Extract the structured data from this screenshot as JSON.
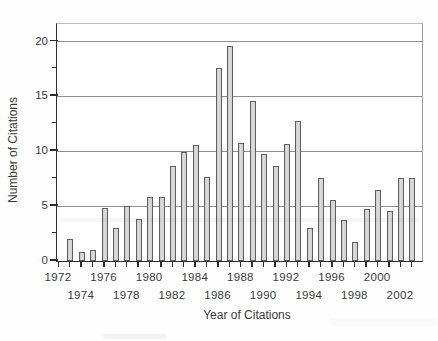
{
  "chart_data": {
    "type": "bar",
    "title": "",
    "xlabel": "Year of Citations",
    "ylabel": "Number of Citations",
    "categories": [
      1973,
      1974,
      1975,
      1976,
      1977,
      1978,
      1979,
      1980,
      1981,
      1982,
      1983,
      1984,
      1985,
      1986,
      1987,
      1988,
      1989,
      1990,
      1991,
      1992,
      1993,
      1994,
      1995,
      1996,
      1997,
      1998,
      1999,
      2000,
      2001,
      2002,
      2003
    ],
    "values": [
      2.0,
      0.8,
      1.0,
      4.8,
      3.0,
      5.0,
      3.8,
      5.8,
      5.8,
      8.7,
      9.9,
      10.6,
      7.7,
      17.6,
      19.6,
      10.8,
      14.6,
      9.8,
      8.7,
      10.7,
      12.8,
      3.0,
      7.6,
      5.6,
      3.7,
      1.7,
      4.7,
      6.5,
      4.6,
      7.6,
      7.6
    ],
    "ylim": [
      0,
      21.6
    ],
    "grid": "horizontal-major-only",
    "legend": "none",
    "y_axis": {
      "tick_values": [
        0,
        5,
        10,
        15,
        20
      ],
      "tick_labels": [
        "0",
        "5",
        "10",
        "15",
        "20"
      ],
      "minor_tick_values": [
        2.5,
        7.5,
        12.5,
        17.5
      ]
    },
    "x_axis": {
      "first_tick_year": 1972,
      "last_tick_year": 2003,
      "tick_every_years": 1,
      "label_row_1": [
        "1972",
        "1976",
        "1980",
        "1984",
        "1988",
        "1992",
        "1996",
        "2000"
      ],
      "label_row_2": [
        "1974",
        "1978",
        "1982",
        "1986",
        "1990",
        "1994",
        "1998",
        "2002"
      ]
    },
    "colors": {
      "bar_fill": "#d5d5d5",
      "bar_edge": "#5f5f5f",
      "gridline": "#8f8f8f",
      "axis": "#2e2e2e",
      "frame_top": "#bcbcbc",
      "frame_right": "#9e9e9e",
      "text": "#3b3b3b",
      "background": "#ffffff"
    }
  }
}
